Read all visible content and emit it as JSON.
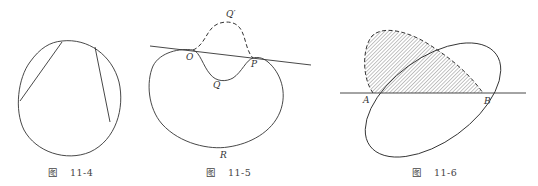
{
  "figures": [
    {
      "id": "fig-11-4",
      "caption": {
        "prefix": "图",
        "number": "11-4"
      },
      "description": "Closed convex oval with two chords"
    },
    {
      "id": "fig-11-5",
      "caption": {
        "prefix": "图",
        "number": "11-5"
      },
      "labels": {
        "O": "O",
        "P": "P",
        "Q": "Q",
        "Q_prime": "Q′",
        "R": "R"
      },
      "description": "Kidney-shaped curve with a line touching it at O and P; dashed reflected arc OQ′P"
    },
    {
      "id": "fig-11-6",
      "caption": {
        "prefix": "图",
        "number": "11-6"
      },
      "labels": {
        "A": "A",
        "B": "B"
      },
      "description": "Tilted ellipse cut by a horizontal line at A and B; hatched region bounded by dashed reflected arc"
    }
  ]
}
